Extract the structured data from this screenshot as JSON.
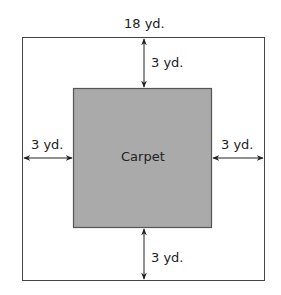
{
  "diagram": {
    "outer_width_label": "18 yd.",
    "top_gap_label": "3 yd.",
    "left_gap_label": "3 yd.",
    "right_gap_label": "3 yd.",
    "bottom_gap_label": "3 yd.",
    "inner_label": "Carpet",
    "colors": {
      "carpet_fill": "#aaaaaa",
      "carpet_border": "#555555",
      "outer_border": "#444444",
      "arrow": "#222222"
    }
  }
}
